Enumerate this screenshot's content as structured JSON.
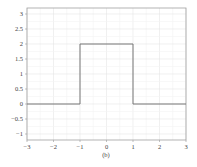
{
  "chart_data": {
    "type": "line",
    "title": "",
    "caption": "(b)",
    "xlabel": "",
    "ylabel": "",
    "xlim": [
      -3,
      3
    ],
    "ylim": [
      -1.2,
      3.2
    ],
    "grid": true,
    "legend": null,
    "x_ticks": [
      "−3",
      "−2",
      "−1",
      "0",
      "1",
      "2",
      "3"
    ],
    "y_ticks": [
      "3",
      "2.5",
      "2",
      "1.5",
      "1",
      "0.5",
      "0",
      "−0.5",
      "−1"
    ],
    "series": [
      {
        "name": "rectangular pulse",
        "x": [
          -3,
          -1,
          -1,
          1,
          1,
          3
        ],
        "y": [
          0,
          0,
          2,
          2,
          0,
          0
        ]
      }
    ],
    "colors": {
      "line": "#777777",
      "grid": "#ececec",
      "axis": "#999999"
    }
  }
}
